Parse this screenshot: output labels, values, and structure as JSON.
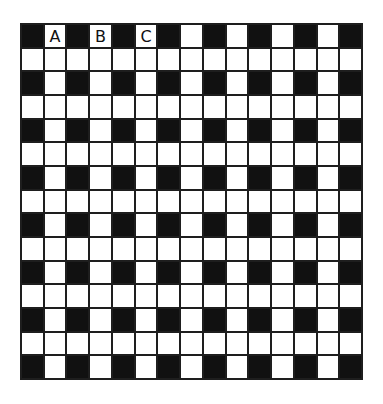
{
  "puzzle": {
    "rows": 15,
    "cols": 15,
    "colors": {
      "black": "#111111",
      "white": "#ffffff",
      "line": "#1e1e1e"
    },
    "pattern_rule": "Odd-numbered rows (1st, 3rd, ... 15th) have black cells at every other column starting with column 1; even-numbered rows are entirely white.",
    "labels": [
      {
        "row": 0,
        "col": 1,
        "text": "A"
      },
      {
        "row": 0,
        "col": 3,
        "text": "B"
      },
      {
        "row": 0,
        "col": 5,
        "text": "C"
      }
    ],
    "grid": [
      "#.#.#.#.#.#.#.#",
      "...............",
      "#.#.#.#.#.#.#.#",
      "...............",
      "#.#.#.#.#.#.#.#",
      "...............",
      "#.#.#.#.#.#.#.#",
      "...............",
      "#.#.#.#.#.#.#.#",
      "...............",
      "#.#.#.#.#.#.#.#",
      "...............",
      "#.#.#.#.#.#.#.#",
      "...............",
      "#.#.#.#.#.#.#.#"
    ]
  }
}
